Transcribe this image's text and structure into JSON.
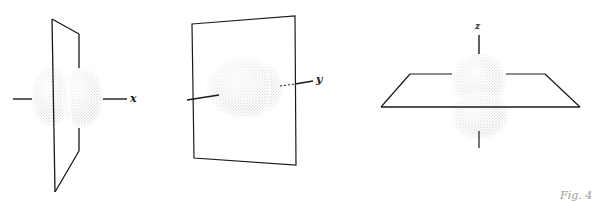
{
  "figure": {
    "background": "#ffffff",
    "line_color": "#1a1a1a",
    "stipple_color": "#8c8c8c",
    "caption": "Fig. 4",
    "panels": [
      {
        "id": "px",
        "axis_label": "x",
        "description": "p orbital along x axis with nodal plane yz (vertical plane)"
      },
      {
        "id": "py",
        "axis_label": "y",
        "description": "p orbital along y axis with nodal plane xz (frontal plane)"
      },
      {
        "id": "pz",
        "axis_label": "z",
        "description": "p orbital along z axis with nodal plane xy (horizontal plane)"
      }
    ]
  }
}
